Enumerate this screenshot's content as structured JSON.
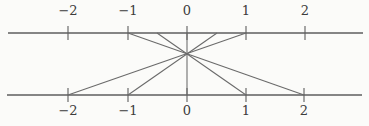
{
  "figure": {
    "width": 369,
    "height": 126,
    "background_color": "#fbfbf9",
    "line_color": "#5e5e5e",
    "ray_color": "#6a6a6a",
    "label_color": "#3c3c3c"
  },
  "axes": {
    "top": {
      "y": 33,
      "x_start": 8,
      "x_end": 363,
      "tick_half_length": 7,
      "labels": [
        {
          "text": "−2",
          "value": -2,
          "x": 68,
          "label_y": 4
        },
        {
          "text": "−1",
          "value": -1,
          "x": 128,
          "label_y": 4
        },
        {
          "text": "0",
          "value": 0,
          "x": 187,
          "label_y": 4
        },
        {
          "text": "1",
          "value": 1,
          "x": 246,
          "label_y": 4
        },
        {
          "text": "2",
          "value": 2,
          "x": 305,
          "label_y": 4
        }
      ]
    },
    "bottom": {
      "y": 95,
      "x_start": 7,
      "x_end": 362,
      "tick_half_length": 7,
      "labels": [
        {
          "text": "−2",
          "value": -2,
          "x": 68,
          "label_y": 104
        },
        {
          "text": "−1",
          "value": -1,
          "x": 128,
          "label_y": 104
        },
        {
          "text": "0",
          "value": 0,
          "x": 187,
          "label_y": 104
        },
        {
          "text": "1",
          "value": 1,
          "x": 246,
          "label_y": 104
        },
        {
          "text": "2",
          "value": 2,
          "x": 304,
          "label_y": 104
        }
      ]
    }
  },
  "projection": {
    "center": {
      "x": 187,
      "y": 54
    },
    "rays": [
      {
        "top_x": 128,
        "bottom_x": 304,
        "maps": "top −1 → bottom 2"
      },
      {
        "top_x": 157,
        "bottom_x": 246,
        "maps": "top −1/2 → bottom 1"
      },
      {
        "top_x": 187,
        "bottom_x": 187,
        "maps": "top 0 → bottom 0"
      },
      {
        "top_x": 217,
        "bottom_x": 128,
        "maps": "top 1/2 → bottom −1"
      },
      {
        "top_x": 246,
        "bottom_x": 68,
        "maps": "top 1 → bottom −2"
      }
    ]
  }
}
